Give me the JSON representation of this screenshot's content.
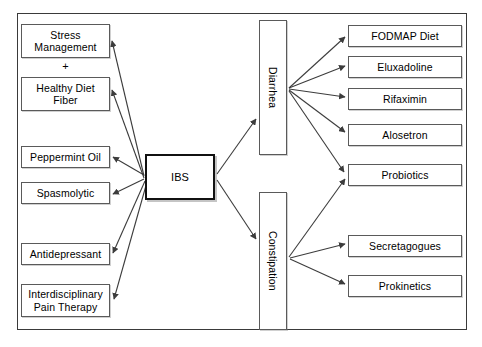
{
  "diagram": {
    "center_node": {
      "label": "IBS"
    },
    "left_nodes": [
      {
        "label": "Stress\nManagement"
      },
      {
        "label": "Healthy Diet\nFiber"
      },
      {
        "label": "Peppermint Oil"
      },
      {
        "label": "Spasmolytic"
      },
      {
        "label": "Antidepressant"
      },
      {
        "label": "Interdisciplinary\nPain Therapy"
      }
    ],
    "plus_connector": {
      "label": "+"
    },
    "subtype_nodes": [
      {
        "label": "Diarrhea"
      },
      {
        "label": "Constipation"
      }
    ],
    "right_nodes": [
      {
        "label": "FODMAP Diet"
      },
      {
        "label": "Eluxadoline"
      },
      {
        "label": "Rifaximin"
      },
      {
        "label": "Alosetron"
      },
      {
        "label": "Probiotics"
      },
      {
        "label": "Secretagogues"
      },
      {
        "label": "Prokinetics"
      }
    ],
    "colors": {
      "background": "#ffffff",
      "frame_stroke": "#3a3a3a",
      "box_stroke": "#5a5a5a",
      "center_box_stroke": "#111111",
      "arrow_stroke": "#3c3c3c",
      "text": "#000000"
    }
  }
}
